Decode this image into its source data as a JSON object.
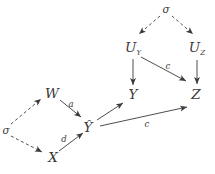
{
  "figure": {
    "type": "causal-dag",
    "colors": {
      "ink": "#3a3a3a",
      "background": "#ffffff"
    },
    "nodes": {
      "sigma_top": {
        "label": "σ"
      },
      "u_y": {
        "base": "U",
        "sub": "Y"
      },
      "u_z": {
        "base": "U",
        "sub": "Z"
      },
      "y": {
        "label": "Y"
      },
      "z": {
        "label": "Z"
      },
      "sigma_left": {
        "label": "σ"
      },
      "w": {
        "label": "W"
      },
      "x": {
        "label": "X"
      },
      "y_hat": {
        "label": "Ŷ"
      }
    },
    "edges": [
      {
        "id": "sigma-top-to-u-y",
        "from": "sigma_top",
        "to": "u_y",
        "style": "dashed",
        "label": ""
      },
      {
        "id": "sigma-top-to-u-z",
        "from": "sigma_top",
        "to": "u_z",
        "style": "dashed",
        "label": ""
      },
      {
        "id": "u-y-to-y",
        "from": "u_y",
        "to": "y",
        "style": "solid",
        "label": ""
      },
      {
        "id": "u-y-to-z",
        "from": "u_y",
        "to": "z",
        "style": "solid",
        "label": "c"
      },
      {
        "id": "u-z-to-z",
        "from": "u_z",
        "to": "z",
        "style": "solid",
        "label": ""
      },
      {
        "id": "sigma-left-to-w",
        "from": "sigma_left",
        "to": "w",
        "style": "dashed",
        "label": ""
      },
      {
        "id": "sigma-left-to-x",
        "from": "sigma_left",
        "to": "x",
        "style": "dashed",
        "label": ""
      },
      {
        "id": "w-to-y-hat",
        "from": "w",
        "to": "y_hat",
        "style": "solid",
        "label": "a"
      },
      {
        "id": "x-to-y-hat",
        "from": "x",
        "to": "y_hat",
        "style": "solid",
        "label": "d"
      },
      {
        "id": "y-hat-to-y",
        "from": "y_hat",
        "to": "y",
        "style": "solid",
        "label": ""
      },
      {
        "id": "y-hat-to-z",
        "from": "y_hat",
        "to": "z",
        "style": "solid",
        "label": "c"
      }
    ]
  }
}
